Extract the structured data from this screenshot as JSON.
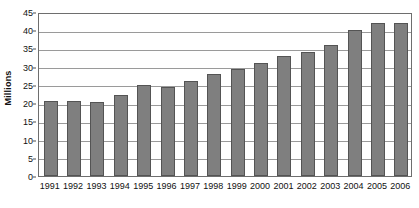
{
  "chart_data": {
    "type": "bar",
    "title": "",
    "subtitle": "",
    "xlabel": "",
    "ylabel": "Millions",
    "categories": [
      "1991",
      "1992",
      "1993",
      "1994",
      "1995",
      "1996",
      "1997",
      "1998",
      "1999",
      "2000",
      "2001",
      "2002",
      "2003",
      "2004",
      "2005",
      "2006"
    ],
    "values": [
      20.5,
      20.6,
      20.2,
      22.3,
      25.0,
      24.5,
      26.0,
      28.0,
      29.5,
      31.0,
      33.0,
      34.0,
      36.0,
      40.0,
      42.0,
      42.0
    ],
    "ylim": [
      0,
      45
    ],
    "ytick_step": 5,
    "yticks": [
      45,
      40,
      35,
      30,
      25,
      20,
      15,
      10,
      5,
      0
    ],
    "grid": "horizontal",
    "legend": "none",
    "annotations": [],
    "colors": {
      "bar_fill": "#7f7f7f",
      "bar_border": "#545454",
      "gridline": "#9a9a9a",
      "frame": "#6e6e6e",
      "text": "#111111",
      "background": "#ffffff"
    }
  }
}
